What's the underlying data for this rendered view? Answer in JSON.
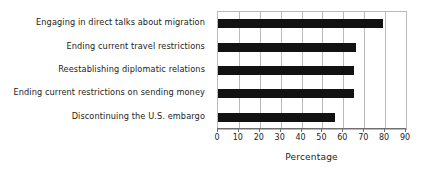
{
  "chart_data": {
    "type": "bar",
    "orientation": "horizontal",
    "title": "",
    "xlabel": "Percentage",
    "ylabel": "",
    "xlim": [
      0,
      90
    ],
    "xticks": [
      0,
      10,
      20,
      30,
      40,
      50,
      60,
      70,
      80,
      90
    ],
    "grid": true,
    "legend": null,
    "bar_color": "#121212",
    "grid_color": "#b9b9b9",
    "axis_color": "#6f6f6f",
    "text_color": "#232323",
    "categories": [
      "Engaging in direct talks about migration",
      "Ending current travel restrictions",
      "Reestablishing diplomatic relations",
      "Ending current restrictions on sending money",
      "Discontinuing the U.S. embargo"
    ],
    "values": [
      79,
      66,
      65,
      65,
      56
    ]
  }
}
